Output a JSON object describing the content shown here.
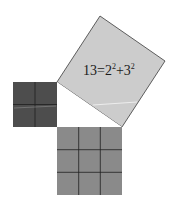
{
  "diagram": {
    "equation": {
      "base1": "13=2",
      "exp1": "2",
      "plus": "+3",
      "exp2": "2"
    },
    "squares": [
      {
        "name": "small-square",
        "side_units": 2,
        "grid": [
          2,
          2
        ],
        "color": "#4d4d4d"
      },
      {
        "name": "medium-square",
        "side_units": 3,
        "grid": [
          3,
          3
        ],
        "color": "#8a8a8a"
      },
      {
        "name": "hypotenuse-square",
        "area": 13,
        "color": "#cccccc"
      }
    ],
    "colors": {
      "grid_line": "#1f1f1f",
      "outline": "#3a3a3a",
      "background": "#ffffff"
    }
  }
}
